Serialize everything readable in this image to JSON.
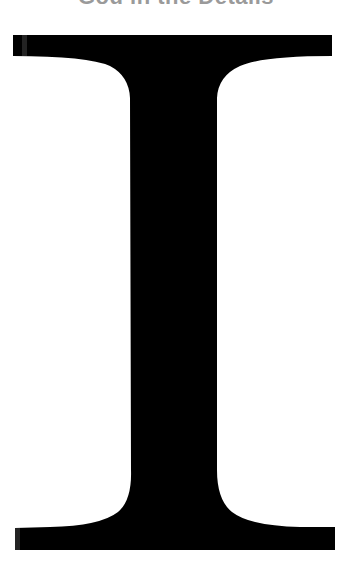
{
  "header": {
    "title": "God in the Details"
  },
  "glyph": {
    "character": "I",
    "style": "serif capital letter",
    "fill_color": "#000000",
    "edge_highlight_color": "#3a3a3a",
    "background_color": "#ffffff"
  },
  "colors": {
    "title": "#9a9a9a",
    "glyph": "#000000",
    "background": "#ffffff"
  }
}
